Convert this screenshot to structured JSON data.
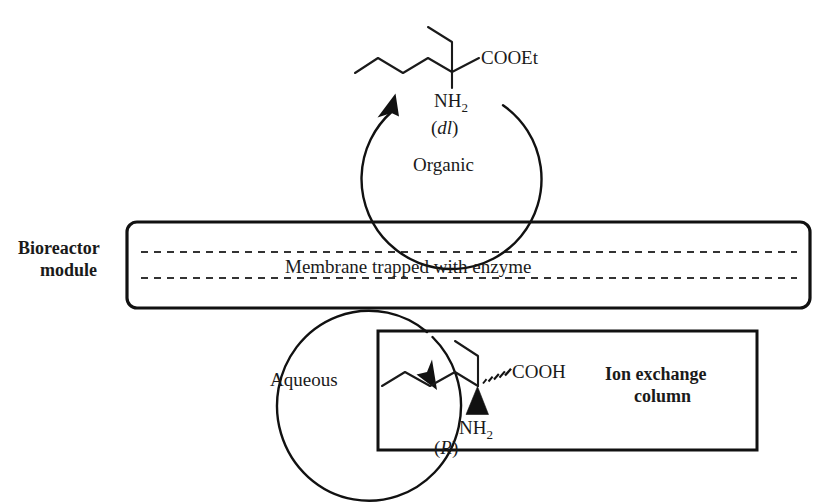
{
  "figure": {
    "type": "process-flow-diagram",
    "background_color": "#ffffff",
    "line_color": "#111111",
    "text_color": "#1a1a1a"
  },
  "labels": {
    "bioreactor_line1": "Bioreactor",
    "bioreactor_line2": "module",
    "membrane": "Membrane trapped with enzyme",
    "organic_phase": "Organic",
    "aqueous_phase": "Aqueous",
    "ion_exchange_line1": "Ion exchange",
    "ion_exchange_line2": "column"
  },
  "molecules": {
    "substrate": {
      "name": "racemic amino ester",
      "ester_group": "COOEt",
      "amine_group_main": "NH",
      "amine_group_sub": "2",
      "stereo_descriptor": "(dl)",
      "stereo_descriptor_italic": "dl",
      "stereo_open": "(",
      "stereo_close": ")"
    },
    "product": {
      "name": "R amino acid",
      "acid_group": "COOH",
      "amine_group_main": "NH",
      "amine_group_sub": "2",
      "stereo_descriptor": "(R)",
      "stereo_descriptor_italic": "R",
      "stereo_open": "(",
      "stereo_close": ")",
      "wedge_bond": "solid-wedge-to-NH2",
      "hash_bond": "hashed-wedge-to-COOH"
    }
  },
  "flows": {
    "organic_loop_direction": "counter-clockwise",
    "aqueous_loop_direction": "clockwise",
    "organic_arrow": "arrow-up-right",
    "aqueous_arrow": "arrow-down-right"
  }
}
